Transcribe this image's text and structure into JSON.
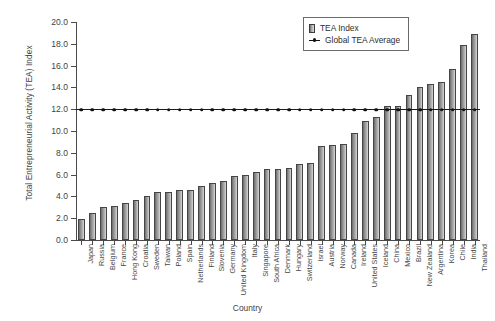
{
  "chart_data": {
    "type": "bar",
    "title": "",
    "xlabel": "Country",
    "ylabel": "Total Entrepreneurial Activity (TEA) Index",
    "ylim": [
      0.0,
      20.0
    ],
    "ytick_step": 2.0,
    "yticks": [
      "20.0",
      "18.0",
      "16.0",
      "14.0",
      "12.0",
      "10.0",
      "8.0",
      "6.0",
      "4.0",
      "2.0",
      "0.0"
    ],
    "grid": false,
    "legend_position": "top-right",
    "legend": [
      "TEA Index",
      "Global TEA Average"
    ],
    "categories": [
      "Japan",
      "Russia",
      "Belgium",
      "France",
      "Hong Kong",
      "Croatia",
      "Sweden",
      "Taiwan",
      "Poland",
      "Spain",
      "Netherlands",
      "Finland",
      "Slovenia",
      "Germany",
      "United Kingdom",
      "Italy",
      "Singapore",
      "South Africa",
      "Denmark",
      "Hungary",
      "Switzerland",
      "Israel",
      "Austria",
      "Norway",
      "Canada",
      "Ireland",
      "United States",
      "Iceland",
      "China",
      "Mexico",
      "Brazil",
      "New Zealand",
      "Argentina",
      "Korea",
      "Chile",
      "India",
      "Thailand"
    ],
    "series": [
      {
        "name": "TEA Index",
        "type": "bar",
        "values": [
          1.9,
          2.5,
          3.0,
          3.1,
          3.4,
          3.7,
          4.0,
          4.4,
          4.4,
          4.6,
          4.6,
          5.0,
          5.2,
          5.4,
          5.9,
          6.0,
          6.2,
          6.5,
          6.5,
          6.6,
          7.0,
          7.1,
          8.6,
          8.7,
          8.8,
          9.8,
          10.9,
          11.3,
          12.3,
          12.3,
          13.3,
          14.0,
          14.3,
          14.5,
          15.7,
          17.9,
          18.9
        ]
      },
      {
        "name": "Global TEA Average",
        "type": "line",
        "constant_value": 12.0
      }
    ]
  },
  "legend": {
    "bar_label": "TEA Index",
    "line_label": "Global TEA Average"
  },
  "axes": {
    "y_title": "Total Entrepreneurial Activity (TEA) Index",
    "x_title": "Country"
  }
}
